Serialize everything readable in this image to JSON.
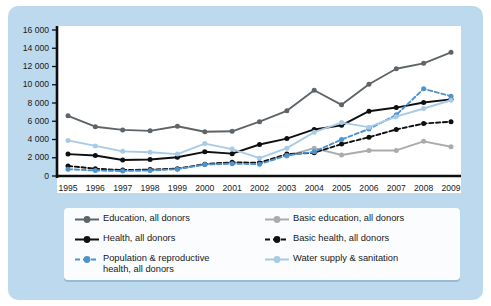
{
  "chart_data": {
    "type": "line",
    "title": "",
    "subtitle": "",
    "xlabel": "",
    "ylabel": "",
    "x": [
      1995,
      1996,
      1997,
      1998,
      1999,
      2000,
      2001,
      2002,
      2003,
      2004,
      2005,
      2006,
      2007,
      2008,
      2009
    ],
    "categories": [
      "1995",
      "1996",
      "1997",
      "1998",
      "1999",
      "2000",
      "2001",
      "2002",
      "2003",
      "2004",
      "2005",
      "2006",
      "2007",
      "2008",
      "2009"
    ],
    "xlim": [
      1995,
      2009
    ],
    "ylim": [
      0,
      16000
    ],
    "yticks": [
      0,
      2000,
      4000,
      6000,
      8000,
      10000,
      12000,
      14000,
      16000
    ],
    "ytick_labels": [
      "0",
      "2 000",
      "4 000",
      "6 000",
      "8 000",
      "10 000",
      "12 000",
      "14 000",
      "16 000"
    ],
    "grid": false,
    "legend_position": "below",
    "series": [
      {
        "name": "Education, all donors",
        "color": "#5e6468",
        "dash": "solid",
        "values": [
          6600,
          5400,
          5050,
          4950,
          5450,
          4850,
          4900,
          5950,
          7150,
          9400,
          7800,
          10050,
          11750,
          12350,
          13550
        ]
      },
      {
        "name": "Basic education, all donors",
        "color": "#a9acae",
        "dash": "solid",
        "values": [
          null,
          null,
          null,
          null,
          null,
          null,
          null,
          null,
          2200,
          3050,
          2300,
          2800,
          2800,
          3800,
          3200
        ]
      },
      {
        "name": "Health, all donors",
        "color": "#0d0f11",
        "dash": "solid",
        "values": [
          2400,
          2250,
          1750,
          1800,
          2050,
          2650,
          2450,
          3450,
          4100,
          5100,
          5550,
          7100,
          7500,
          8050,
          8400
        ]
      },
      {
        "name": "Basic health, all donors",
        "color": "#0d0f11",
        "dash": "dashed",
        "values": [
          1100,
          800,
          650,
          700,
          800,
          1300,
          1500,
          1450,
          2400,
          2550,
          3500,
          4250,
          5100,
          5750,
          5950
        ]
      },
      {
        "name": "Population & reproductive\nhealth, all donors",
        "color": "#4e93cc",
        "dash": "dashed",
        "values": [
          750,
          600,
          550,
          600,
          750,
          1250,
          1350,
          1300,
          2250,
          2650,
          4000,
          5150,
          6700,
          9550,
          8750
        ]
      },
      {
        "name": "Water supply & sanitation",
        "color": "#a7cbe7",
        "dash": "solid",
        "values": [
          3900,
          3300,
          2700,
          2600,
          2400,
          3550,
          2950,
          1950,
          3050,
          4800,
          5850,
          5350,
          6500,
          7400,
          8300
        ]
      }
    ]
  },
  "legend": {
    "items": [
      {
        "label": "Education, all donors",
        "color": "#5e6468",
        "dash": "solid"
      },
      {
        "label": "Basic education, all donors",
        "color": "#a9acae",
        "dash": "solid"
      },
      {
        "label": "Health, all donors",
        "color": "#0d0f11",
        "dash": "solid"
      },
      {
        "label": "Basic health, all donors",
        "color": "#0d0f11",
        "dash": "dashed"
      },
      {
        "label": "Population & reproductive\nhealth, all donors",
        "color": "#4e93cc",
        "dash": "dashed"
      },
      {
        "label": "Water supply & sanitation",
        "color": "#a7cbe7",
        "dash": "solid"
      }
    ]
  },
  "colors": {
    "panel_background": "#bcd9ee",
    "plot_background": "#ffffff",
    "axis": "#0d0f11",
    "legend_background": "#fbfcfd",
    "text": "#17191c"
  }
}
